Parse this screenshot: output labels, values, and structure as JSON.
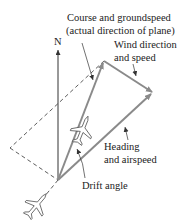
{
  "diagram": {
    "north_label": "N",
    "course_label": [
      "Course and groundspeed",
      "(actual direction of plane)"
    ],
    "wind_label": [
      "Wind direction",
      "and speed"
    ],
    "heading_label": [
      "Heading",
      "and airspeed"
    ],
    "drift_label": "Drift angle",
    "colors": {
      "vector": "#8a8a8a",
      "line": "#333333",
      "text": "#222222"
    }
  }
}
